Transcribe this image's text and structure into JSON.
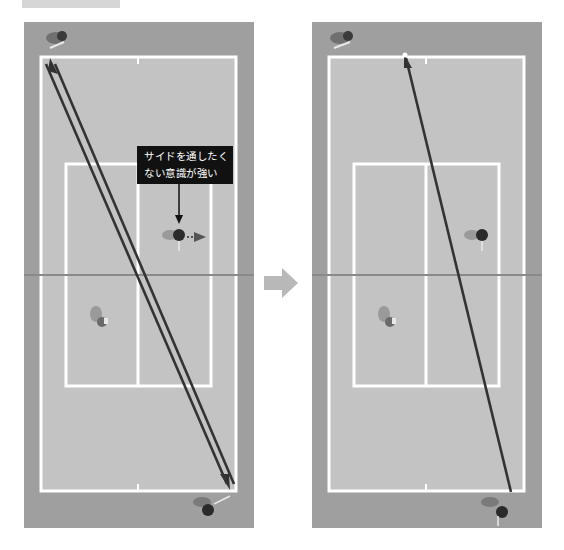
{
  "figure": {
    "top_label": "",
    "panels": [
      {
        "id": "before",
        "description": "Cross-court double-line rally path from top-left baseline to bottom-right baseline",
        "callout": {
          "line1": "サイドを通したく",
          "line2": "ない意識が強い"
        },
        "net_player_movement": "right"
      },
      {
        "id": "after",
        "description": "Single shot path from top baseline center to bottom-right baseline"
      }
    ],
    "transition_arrow": "right-arrow"
  },
  "colors": {
    "court_outer": "#9f9f9f",
    "court_inner": "#c3c3c3",
    "lines": "#ffffff",
    "shot_path": "#3a3a3a",
    "callout_bg": "#111111",
    "arrow": "#b8b8b8"
  }
}
